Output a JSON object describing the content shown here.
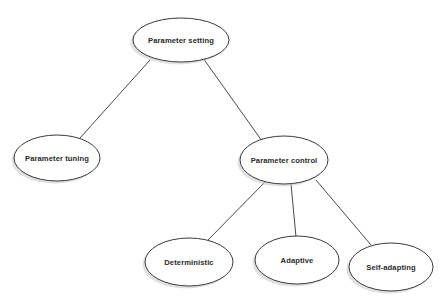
{
  "diagram": {
    "type": "tree",
    "title": "Parameter setting",
    "background_color": "#ffffff",
    "node_fill_color": "#ffffff",
    "node_stroke_color": "#3a3a3a",
    "node_shadow_color": "#c9c9c9",
    "text_color": "#2b2b2b",
    "connector_color": "#4a4a4a",
    "nodes": [
      {
        "id": "parameter-setting",
        "label": "Parameter setting",
        "shape": "ellipse",
        "cx": 181,
        "cy": 40,
        "rx": 48,
        "ry": 22,
        "level": 0
      },
      {
        "id": "parameter-tuning",
        "label": "Parameter tuning",
        "shape": "ellipse",
        "cx": 57,
        "cy": 158,
        "rx": 43,
        "ry": 23,
        "level": 1
      },
      {
        "id": "parameter-control",
        "label": "Parameter control",
        "shape": "ellipse",
        "cx": 284,
        "cy": 160,
        "rx": 44,
        "ry": 24,
        "level": 1
      },
      {
        "id": "deterministic",
        "label": "Deterministic",
        "shape": "ellipse",
        "cx": 189,
        "cy": 262,
        "rx": 44,
        "ry": 24,
        "level": 2
      },
      {
        "id": "adaptive",
        "label": "Adaptive",
        "shape": "ellipse",
        "cx": 297,
        "cy": 260,
        "rx": 42,
        "ry": 24,
        "level": 2
      },
      {
        "id": "self-adapting",
        "label": "Self-adapting",
        "shape": "ellipse",
        "cx": 391,
        "cy": 267,
        "rx": 42,
        "ry": 24,
        "level": 2
      }
    ],
    "edges": [
      {
        "id": "edge-setting-tuning",
        "from": "parameter-setting",
        "to": "parameter-tuning",
        "x1": 150,
        "y1": 60,
        "x2": 80,
        "y2": 138
      },
      {
        "id": "edge-setting-control",
        "from": "parameter-setting",
        "to": "parameter-control",
        "x1": 203,
        "y1": 58,
        "x2": 262,
        "y2": 141
      },
      {
        "id": "edge-control-deterministic",
        "from": "parameter-control",
        "to": "deterministic",
        "x1": 266,
        "y1": 181,
        "x2": 208,
        "y2": 240
      },
      {
        "id": "edge-control-adaptive",
        "from": "parameter-control",
        "to": "adaptive",
        "x1": 291,
        "y1": 184,
        "x2": 296,
        "y2": 237
      },
      {
        "id": "edge-control-self-adapting",
        "from": "parameter-control",
        "to": "self-adapting",
        "x1": 316,
        "y1": 180,
        "x2": 371,
        "y2": 245
      }
    ]
  }
}
